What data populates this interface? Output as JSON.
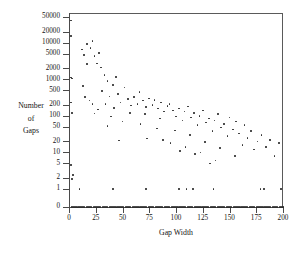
{
  "chart_data": {
    "type": "scatter",
    "title": "",
    "xlabel": "Gap Width",
    "ylabel": "Number of Gaps",
    "ylabel_lines": [
      "Number",
      "of",
      "Gaps"
    ],
    "xlim": [
      0,
      200
    ],
    "xticks": [
      0,
      25,
      50,
      75,
      100,
      125,
      150,
      175,
      200
    ],
    "xtick_labels": [
      "0",
      "25",
      "50",
      "75",
      "100",
      "125",
      "150",
      "175",
      "200"
    ],
    "yscale": "log-with-zero",
    "yticks": [
      0,
      1,
      2,
      5,
      10,
      20,
      50,
      100,
      200,
      500,
      1000,
      2000,
      5000,
      10000,
      20000,
      50000
    ],
    "ytick_labels": [
      "0",
      "1",
      "2",
      "5",
      "10",
      "20",
      "50",
      "100",
      "200",
      "500",
      "1000",
      "2000",
      "5000",
      "10000",
      "20000",
      "50000"
    ],
    "grid": false,
    "legend": false,
    "marker": "dot",
    "marker_color": "#2a2a2a",
    "frame": "top-right-border",
    "points": [
      [
        2,
        40000
      ],
      [
        2,
        15000
      ],
      [
        2,
        1100
      ],
      [
        3,
        1050
      ],
      [
        2,
        230
      ],
      [
        3,
        120
      ],
      [
        2,
        4.5
      ],
      [
        4,
        2.4
      ],
      [
        3,
        1.9
      ],
      [
        12,
        6500
      ],
      [
        14,
        4600
      ],
      [
        17,
        9000
      ],
      [
        20,
        7000
      ],
      [
        22,
        11000
      ],
      [
        24,
        4300
      ],
      [
        17,
        2600
      ],
      [
        13,
        640
      ],
      [
        15,
        330
      ],
      [
        19,
        260
      ],
      [
        22,
        210
      ],
      [
        26,
        2700
      ],
      [
        28,
        5200
      ],
      [
        30,
        2100
      ],
      [
        33,
        1300
      ],
      [
        36,
        900
      ],
      [
        31,
        480
      ],
      [
        34,
        210
      ],
      [
        27,
        150
      ],
      [
        24,
        115
      ],
      [
        38,
        340
      ],
      [
        41,
        700
      ],
      [
        44,
        1150
      ],
      [
        46,
        400
      ],
      [
        48,
        230
      ],
      [
        42,
        165
      ],
      [
        39,
        95
      ],
      [
        36,
        52
      ],
      [
        52,
        600
      ],
      [
        55,
        290
      ],
      [
        58,
        190
      ],
      [
        61,
        330
      ],
      [
        64,
        210
      ],
      [
        57,
        120
      ],
      [
        50,
        70
      ],
      [
        47,
        21
      ],
      [
        66,
        450
      ],
      [
        69,
        260
      ],
      [
        72,
        175
      ],
      [
        75,
        300
      ],
      [
        78,
        195
      ],
      [
        71,
        110
      ],
      [
        67,
        60
      ],
      [
        73,
        24
      ],
      [
        80,
        270
      ],
      [
        83,
        160
      ],
      [
        86,
        230
      ],
      [
        89,
        130
      ],
      [
        92,
        185
      ],
      [
        85,
        85
      ],
      [
        82,
        45
      ],
      [
        88,
        22
      ],
      [
        94,
        210
      ],
      [
        97,
        140
      ],
      [
        100,
        95
      ],
      [
        103,
        160
      ],
      [
        106,
        75
      ],
      [
        99,
        40
      ],
      [
        95,
        18
      ],
      [
        104,
        11
      ],
      [
        108,
        130
      ],
      [
        111,
        180
      ],
      [
        114,
        90
      ],
      [
        117,
        120
      ],
      [
        120,
        55
      ],
      [
        113,
        30
      ],
      [
        109,
        14
      ],
      [
        118,
        9
      ],
      [
        122,
        100
      ],
      [
        125,
        140
      ],
      [
        128,
        65
      ],
      [
        131,
        85
      ],
      [
        134,
        38
      ],
      [
        127,
        19
      ],
      [
        123,
        10
      ],
      [
        132,
        5
      ],
      [
        136,
        75
      ],
      [
        139,
        110
      ],
      [
        142,
        48
      ],
      [
        145,
        60
      ],
      [
        148,
        28
      ],
      [
        141,
        13
      ],
      [
        137,
        6
      ],
      [
        150,
        90
      ],
      [
        153,
        42
      ],
      [
        156,
        70
      ],
      [
        159,
        33
      ],
      [
        162,
        16
      ],
      [
        155,
        8
      ],
      [
        164,
        55
      ],
      [
        167,
        25
      ],
      [
        170,
        38
      ],
      [
        173,
        12
      ],
      [
        176,
        20
      ],
      [
        180,
        30
      ],
      [
        184,
        14
      ],
      [
        188,
        22
      ],
      [
        192,
        8
      ],
      [
        196,
        18
      ],
      [
        10,
        1
      ],
      [
        41,
        1
      ],
      [
        72,
        1
      ],
      [
        103,
        1
      ],
      [
        110,
        1
      ],
      [
        116,
        1
      ],
      [
        135,
        1
      ],
      [
        179,
        1
      ],
      [
        182,
        1
      ],
      [
        198,
        1
      ]
    ],
    "zero_row": {
      "y": 0,
      "description": "dense row of points at count 0 spanning the full gap-width range",
      "x_start": 3,
      "x_end": 200,
      "count": 120
    }
  }
}
